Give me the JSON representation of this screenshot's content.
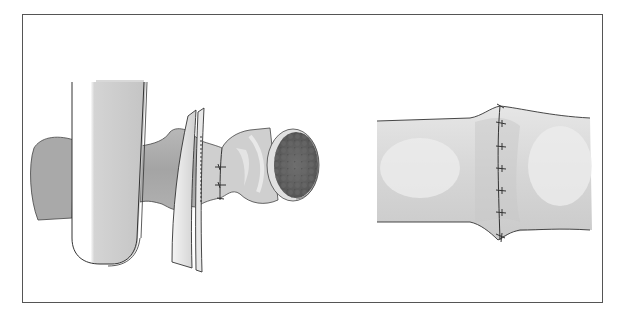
{
  "figure": {
    "type": "surgical-illustration",
    "panels": [
      {
        "id": "left",
        "description": "bowel segment clamped with retractor and forceps, sutures placed proximal to mass"
      },
      {
        "id": "right",
        "description": "completed end-to-end anastomosis with interrupted sutures"
      }
    ],
    "colors": {
      "frame": "#555555",
      "outline": "#333333",
      "tissue_light": "#d8d8d8",
      "tissue_mid": "#b4b4b4",
      "tissue_dark": "#8e8e8e",
      "mass": "#5e5e5e",
      "background": "#ffffff"
    },
    "left_panel_sutures": 3,
    "right_panel_sutures": 6
  }
}
